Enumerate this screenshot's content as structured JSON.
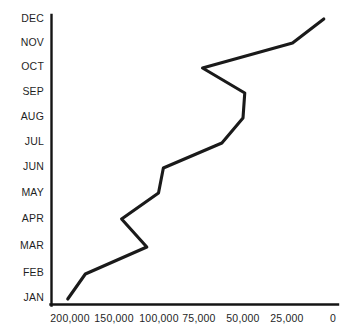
{
  "chart_data": {
    "type": "line",
    "title": "",
    "subtitle": "",
    "xlabel": "",
    "ylabel": "",
    "orientation": "horizontal",
    "grid": false,
    "legend": null,
    "categories": [
      "JAN",
      "FEB",
      "MAR",
      "APR",
      "MAY",
      "JUN",
      "JUL",
      "AUG",
      "SEP",
      "OCT",
      "NOV",
      "DEC"
    ],
    "category_order_top_to_bottom": [
      "DEC",
      "NOV",
      "OCT",
      "SEP",
      "AUG",
      "JUL",
      "JUN",
      "MAY",
      "APR",
      "MAR",
      "FEB",
      "JAN"
    ],
    "values": [
      202000,
      182000,
      113000,
      141000,
      100000,
      97000,
      62000,
      50000,
      49000,
      73000,
      22000,
      5000
    ],
    "x_tick_labels": [
      "200,000",
      "150,000",
      "100,000",
      "75,000",
      "50,000",
      "25,000",
      "0"
    ],
    "x_tick_values": [
      200000,
      150000,
      100000,
      75000,
      50000,
      25000,
      0
    ],
    "xlim": [
      200000,
      0
    ],
    "x_axis_direction": "decreasing-left-to-right",
    "series": [
      {
        "name": "",
        "points": [
          {
            "category": "JAN",
            "value": 202000
          },
          {
            "category": "FEB",
            "value": 182000
          },
          {
            "category": "MAR",
            "value": 113000
          },
          {
            "category": "APR",
            "value": 141000
          },
          {
            "category": "MAY",
            "value": 100000
          },
          {
            "category": "JUN",
            "value": 97000
          },
          {
            "category": "JUL",
            "value": 62000
          },
          {
            "category": "AUG",
            "value": 50000
          },
          {
            "category": "SEP",
            "value": 49000
          },
          {
            "category": "OCT",
            "value": 73000
          },
          {
            "category": "NOV",
            "value": 22000
          },
          {
            "category": "DEC",
            "value": 5000
          }
        ]
      }
    ]
  },
  "axis": {
    "y_labels": [
      "DEC",
      "NOV",
      "OCT",
      "SEP",
      "AUG",
      "JUL",
      "JUN",
      "MAY",
      "APR",
      "MAR",
      "FEB",
      "JAN"
    ],
    "x_labels": [
      "200,000",
      "150,000",
      "100,000",
      "75,000",
      "50,000",
      "25,000",
      "0"
    ]
  },
  "colors": {
    "line": "#1a1a1a",
    "axis": "#141414",
    "text": "#1f1f1f",
    "background": "#ffffff"
  }
}
